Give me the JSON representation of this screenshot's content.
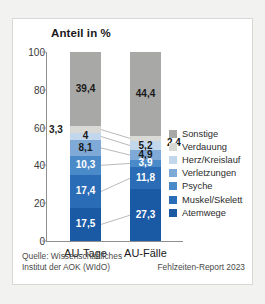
{
  "chart_data": {
    "type": "bar",
    "subtype": "stacked-100-percent",
    "title": "Anteil in %",
    "xlabel": "",
    "ylabel": "",
    "ylim": [
      0,
      100
    ],
    "yticks": [
      "0",
      "20",
      "40",
      "60",
      "80",
      "100"
    ],
    "grid": false,
    "legend_position": "right",
    "categories": [
      "AU-Tage",
      "AU-Fälle"
    ],
    "series": [
      {
        "name": "Atemwege",
        "color": "#1a5aa5",
        "label_color": "#ffffff",
        "values": [
          17.5,
          27.3
        ]
      },
      {
        "name": "Muskel/Skelett",
        "color": "#2a6cb5",
        "label_color": "#ffffff",
        "values": [
          17.4,
          11.8
        ]
      },
      {
        "name": "Psyche",
        "color": "#4b8ac9",
        "label_color": "#ffffff",
        "values": [
          10.3,
          3.9
        ]
      },
      {
        "name": "Verletzungen",
        "color": "#7fa9d6",
        "label_color": "#1a1a1a",
        "values": [
          8.1,
          4.9
        ]
      },
      {
        "name": "Herz/Kreislauf",
        "color": "#c2d7ec",
        "label_color": "#1a1a1a",
        "values": [
          4.0,
          5.2
        ]
      },
      {
        "name": "Verdauung",
        "color": "#d9d9d6",
        "label_color": "#1a1a1a",
        "values": [
          3.3,
          2.4
        ]
      },
      {
        "name": "Sonstige",
        "color": "#a8a8a6",
        "label_color": "#1a1a1a",
        "values": [
          39.4,
          44.4
        ]
      }
    ],
    "value_labels": {
      "AU-Tage": [
        "39,4",
        "3,3",
        "4,0",
        "8,1",
        "10,3",
        "17,4",
        "17,5"
      ],
      "AU-Fälle": [
        "44,4",
        "2,4",
        "5,2",
        "4,9",
        "3,9",
        "11,8",
        "27,3"
      ]
    },
    "external_labels": [
      {
        "text": "3,3",
        "series": "Verdauung",
        "category": "AU-Tage"
      },
      {
        "text": "2,4",
        "series": "Verdauung",
        "category": "AU-Fälle"
      }
    ],
    "legend": [
      {
        "label": "Sonstige",
        "color": "#a8a8a6"
      },
      {
        "label": "Verdauung",
        "color": "#d9d9d6"
      },
      {
        "label": "Herz/Kreislauf",
        "color": "#c2d7ec"
      },
      {
        "label": "Verletzungen",
        "color": "#7fa9d6"
      },
      {
        "label": "Psyche",
        "color": "#4b8ac9"
      },
      {
        "label": "Muskel/Skelett",
        "color": "#2a6cb5"
      },
      {
        "label": "Atemwege",
        "color": "#1a5aa5"
      }
    ]
  },
  "footer": {
    "source": "Quelle: Wissenschaftliches\nInstitut der AOK (WIdO)",
    "report": "Fehlzeiten-Report 2023"
  }
}
